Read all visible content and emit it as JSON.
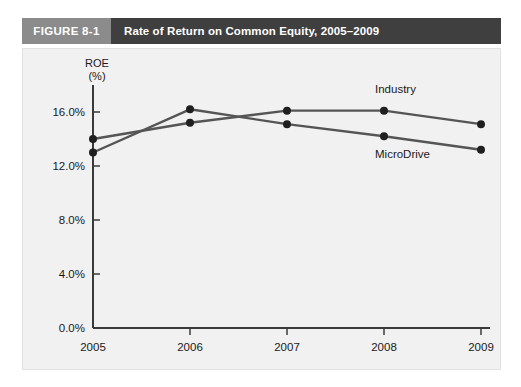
{
  "figure": {
    "number_label": "FIGURE 8-1",
    "title": "Rate of Return on Common Equity, 2005–2009",
    "number_block_color": "#8b8b8b",
    "title_block_color": "#3f3f3f",
    "panel_color": "#f1f1f1"
  },
  "chart_data": {
    "type": "line",
    "title": "Rate of Return on Common Equity, 2005–2009",
    "xlabel": "",
    "ylabel": "ROE",
    "ylabel_line1": "ROE",
    "ylabel_line2": "(%)",
    "categories": [
      "2005",
      "2006",
      "2007",
      "2008",
      "2009"
    ],
    "x": [
      2005,
      2006,
      2007,
      2008,
      2009
    ],
    "series": [
      {
        "name": "Industry",
        "values": [
          14.0,
          15.2,
          16.1,
          16.1,
          15.1
        ],
        "color": "#555555",
        "label": "Industry"
      },
      {
        "name": "MicroDrive",
        "values": [
          13.0,
          16.2,
          15.1,
          14.2,
          13.2
        ],
        "color": "#555555",
        "label": "MicroDrive"
      }
    ],
    "ylim": [
      0.0,
      18.0
    ],
    "ytick_values": [
      0.0,
      4.0,
      8.0,
      12.0,
      16.0
    ],
    "ytick_labels": [
      "0.0%",
      "4.0%",
      "8.0%",
      "12.0%",
      "16.0%"
    ],
    "xtick_labels": [
      "2005",
      "2006",
      "2007",
      "2008",
      "2009"
    ],
    "grid": false,
    "legend_position": "inline-right-of-series",
    "marker": "circle"
  }
}
